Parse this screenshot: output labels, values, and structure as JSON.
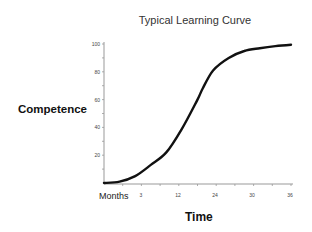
{
  "chart_data": {
    "type": "line",
    "title": "Typical Learning Curve",
    "xlabel": "Time",
    "ylabel": "Competence",
    "x_unit_label": "Months",
    "x_tick_labels": [
      "3",
      "12",
      "24",
      "30",
      "36"
    ],
    "y_tick_labels": [
      "20",
      "40",
      "60",
      "80",
      "100"
    ],
    "xlim": [
      0,
      36
    ],
    "ylim": [
      0,
      100
    ],
    "grid": false,
    "legend": null,
    "series": [
      {
        "name": "Competence",
        "x": [
          0,
          3,
          6,
          9,
          12,
          15,
          18,
          19,
          21,
          24,
          27,
          30,
          33,
          36
        ],
        "values": [
          0,
          1,
          5,
          13,
          22,
          39,
          60,
          68,
          81,
          90,
          95,
          97,
          98.5,
          99.5
        ]
      }
    ]
  }
}
